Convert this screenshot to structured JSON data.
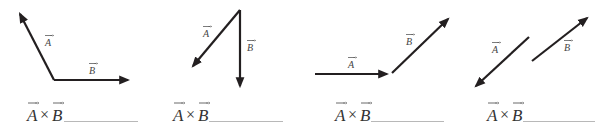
{
  "labels": {
    "A": "A",
    "B": "B",
    "cross": "×"
  },
  "colors": {
    "vector": "#231f20",
    "text": "#333333",
    "blank_line": "#b8b8b8"
  },
  "panels": [
    {
      "id": 1,
      "description": "A points up-left from common tail; B points right from same tail",
      "A": {
        "from": [
          54,
          80
        ],
        "to": [
          20,
          14
        ]
      },
      "B": {
        "from": [
          54,
          80
        ],
        "to": [
          128,
          80
        ]
      },
      "caption": "A × B",
      "answer_blank": ""
    },
    {
      "id": 2,
      "description": "A points down-left and B points straight down, both from common tail at top",
      "A": {
        "from": [
          240,
          10
        ],
        "to": [
          193,
          66
        ]
      },
      "B": {
        "from": [
          240,
          10
        ],
        "to": [
          240,
          86
        ]
      },
      "caption": "A × B",
      "answer_blank": ""
    },
    {
      "id": 3,
      "description": "A points right; B starts at A's head and points up-right",
      "A": {
        "from": [
          315,
          74
        ],
        "to": [
          387,
          74
        ]
      },
      "B": {
        "from": [
          392,
          73
        ],
        "to": [
          448,
          19
        ]
      },
      "caption": "A × B",
      "answer_blank": ""
    },
    {
      "id": 4,
      "description": "A points down-left; B is parallel, pointing up-right (antiparallel vectors)",
      "A": {
        "from": [
          529,
          37
        ],
        "to": [
          476,
          86
        ]
      },
      "B": {
        "from": [
          532,
          61
        ],
        "to": [
          587,
          18
        ]
      },
      "caption": "A × B",
      "answer_blank": ""
    }
  ]
}
